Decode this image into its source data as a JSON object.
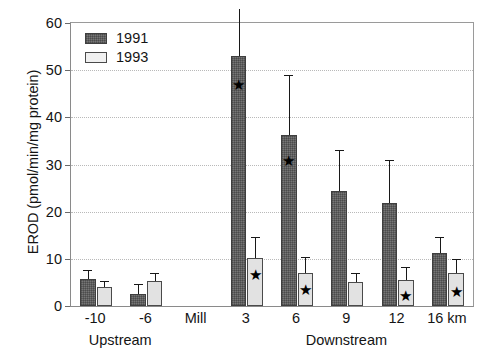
{
  "chart_data": {
    "type": "bar",
    "title": "",
    "subtitle": "",
    "xlabel": "",
    "ylabel": "EROD (pmol/min/mg protein)",
    "ylim": [
      0,
      60
    ],
    "yticks": [
      0,
      10,
      20,
      30,
      40,
      50,
      60
    ],
    "grid": "horizontal-dotted",
    "legend_position": "top-left-inside",
    "categories": [
      "-10",
      "-6",
      "Mill",
      "3",
      "6",
      "9",
      "12",
      "16 km"
    ],
    "group_labels": [
      {
        "text": "Upstream",
        "center_category": "-6",
        "spans": [
          "-10",
          "-6"
        ]
      },
      {
        "text": "Downstream",
        "center_category": "6",
        "spans": [
          "3",
          "6",
          "9",
          "12",
          "16 km"
        ]
      }
    ],
    "series": [
      {
        "name": "1991",
        "color": "#767676",
        "pattern": "cross-hatch",
        "values": [
          5.7,
          2.5,
          null,
          53.0,
          36.2,
          24.3,
          21.9,
          11.3
        ],
        "errors_upper": [
          7.6,
          4.6,
          null,
          63.0,
          49.0,
          33.0,
          31.0,
          14.6
        ]
      },
      {
        "name": "1993",
        "color": "#e2e2e2",
        "pattern": "solid",
        "values": [
          4.0,
          5.2,
          null,
          10.2,
          7.0,
          5.0,
          5.5,
          7.0
        ],
        "errors_upper": [
          5.4,
          6.9,
          null,
          14.6,
          10.3,
          7.0,
          8.2,
          10.0
        ]
      }
    ],
    "significance_marker": "★",
    "significance_markers": [
      {
        "category": "3",
        "series": "1991",
        "value": 47.0
      },
      {
        "category": "3",
        "series": "1993",
        "value": 6.8
      },
      {
        "category": "6",
        "series": "1991",
        "value": 31.0
      },
      {
        "category": "6",
        "series": "1993",
        "value": 3.5
      },
      {
        "category": "12",
        "series": "1993",
        "value": 2.3
      },
      {
        "category": "16 km",
        "series": "1993",
        "value": 3.2
      }
    ]
  },
  "legend": {
    "items": [
      {
        "label": "1991"
      },
      {
        "label": "1993"
      }
    ]
  },
  "axis": {
    "y_title": "EROD (pmol/min/mg protein)",
    "y_tick_labels": [
      "0",
      "10",
      "20",
      "30",
      "40",
      "50",
      "60"
    ],
    "x_tick_labels": [
      "-10",
      "-6",
      "Mill",
      "3",
      "6",
      "9",
      "12",
      "16 km"
    ],
    "x_group_labels": [
      "Upstream",
      "Downstream"
    ]
  }
}
